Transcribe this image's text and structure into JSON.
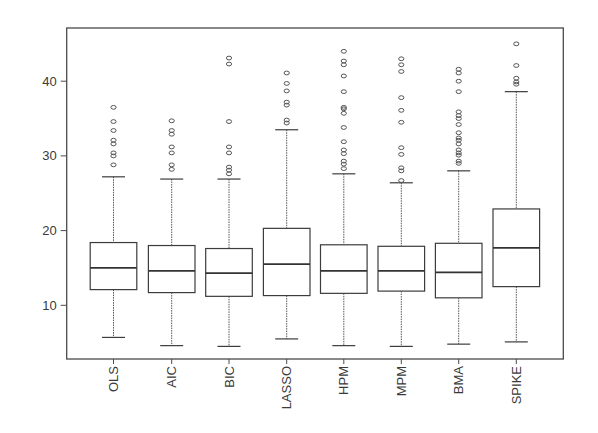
{
  "chart_data": {
    "type": "boxplot",
    "title": "",
    "xlabel": "",
    "ylabel": "",
    "ylim": [
      3.0,
      47.0
    ],
    "yticks": [
      10,
      20,
      30,
      40
    ],
    "grid": false,
    "legend": null,
    "categories": [
      "OLS",
      "AIC",
      "BIC",
      "LASSO",
      "HPM",
      "MPM",
      "BMA",
      "SPIKE"
    ],
    "series": [
      {
        "name": "OLS",
        "lower_whisker": 5.7,
        "q1": 12.1,
        "median": 15.0,
        "q3": 18.4,
        "upper_whisker": 27.2,
        "outliers": [
          28.8,
          30.0,
          30.4,
          31.6,
          32.1,
          33.4,
          34.6,
          36.5
        ]
      },
      {
        "name": "AIC",
        "lower_whisker": 4.6,
        "q1": 11.7,
        "median": 14.6,
        "q3": 18.0,
        "upper_whisker": 26.9,
        "outliers": [
          28.2,
          28.8,
          30.4,
          31.2,
          32.9,
          33.4,
          34.7
        ]
      },
      {
        "name": "BIC",
        "lower_whisker": 4.5,
        "q1": 11.2,
        "median": 14.3,
        "q3": 17.6,
        "upper_whisker": 26.9,
        "outliers": [
          27.6,
          28.1,
          28.5,
          30.4,
          31.2,
          34.6,
          42.3,
          43.1
        ]
      },
      {
        "name": "LASSO",
        "lower_whisker": 5.5,
        "q1": 11.3,
        "median": 15.5,
        "q3": 20.3,
        "upper_whisker": 33.5,
        "outliers": [
          34.4,
          34.8,
          36.8,
          37.2,
          38.7,
          39.7,
          41.1
        ]
      },
      {
        "name": "HPM",
        "lower_whisker": 4.6,
        "q1": 11.6,
        "median": 14.6,
        "q3": 18.1,
        "upper_whisker": 27.6,
        "outliers": [
          28.3,
          28.9,
          29.3,
          30.3,
          30.8,
          31.9,
          33.8,
          35.7,
          36.3,
          36.5,
          38.6,
          40.7,
          42.2,
          42.7,
          44.0
        ]
      },
      {
        "name": "MPM",
        "lower_whisker": 4.5,
        "q1": 11.9,
        "median": 14.6,
        "q3": 17.9,
        "upper_whisker": 26.4,
        "outliers": [
          26.7,
          28.0,
          28.4,
          30.2,
          31.1,
          34.5,
          36.1,
          37.8,
          41.3,
          42.2,
          43.0
        ]
      },
      {
        "name": "BMA",
        "lower_whisker": 4.8,
        "q1": 11.0,
        "median": 14.4,
        "q3": 18.3,
        "upper_whisker": 28.0,
        "outliers": [
          29.0,
          29.3,
          30.1,
          30.4,
          30.8,
          31.6,
          32.1,
          32.4,
          33.1,
          34.2,
          35.0,
          35.4,
          35.9,
          38.6,
          40.0,
          41.1,
          41.6
        ]
      },
      {
        "name": "SPIKE",
        "lower_whisker": 5.1,
        "q1": 12.5,
        "median": 17.7,
        "q3": 22.9,
        "upper_whisker": 38.6,
        "outliers": [
          39.6,
          39.9,
          40.4,
          42.1,
          45.0
        ]
      }
    ]
  },
  "axes": {
    "y_tick_labels": [
      "10",
      "20",
      "30",
      "40"
    ],
    "x_tick_labels": [
      "OLS",
      "AIC",
      "BIC",
      "LASSO",
      "HPM",
      "MPM",
      "BMA",
      "SPIKE"
    ]
  },
  "colors": {
    "background": "#ffffff",
    "stroke": "#3c3c3c",
    "text": "#3a3a3a"
  }
}
